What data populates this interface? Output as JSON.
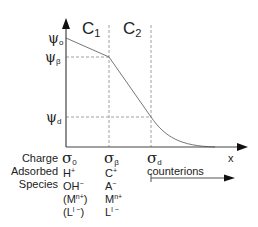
{
  "diagram": {
    "type": "surface potential profile (electric double layer)",
    "axes": {
      "x_label": "x",
      "y_axis_levels": [
        {
          "symbol": "ψ",
          "sub": "o"
        },
        {
          "symbol": "ψ",
          "sub": "β"
        },
        {
          "symbol": "ψ",
          "sub": "d"
        }
      ]
    },
    "regions": [
      {
        "symbol": "C",
        "sub": "1"
      },
      {
        "symbol": "C",
        "sub": "2"
      }
    ],
    "planes": [
      {
        "charge_symbol": "σ",
        "charge_sub": "0",
        "species": [
          {
            "base": "H",
            "sup": "+"
          },
          {
            "base": "OH",
            "sup": "−"
          },
          {
            "base": "(M",
            "sup": "n+",
            "after": ")"
          },
          {
            "base": "(L",
            "sup": "l −",
            "after": ")"
          }
        ]
      },
      {
        "charge_symbol": "σ",
        "charge_sub": "β",
        "species": [
          {
            "base": "C",
            "sup": "+"
          },
          {
            "base": "A",
            "sup": "−"
          },
          {
            "base": "M",
            "sup": "n+"
          },
          {
            "base": "L",
            "sup": "l −"
          }
        ]
      },
      {
        "charge_symbol": "σ",
        "charge_sub": "d",
        "species_label": "counterions"
      }
    ],
    "row_labels": {
      "charge": "Charge",
      "adsorbed": "Adsorbed",
      "species": "Species"
    }
  }
}
